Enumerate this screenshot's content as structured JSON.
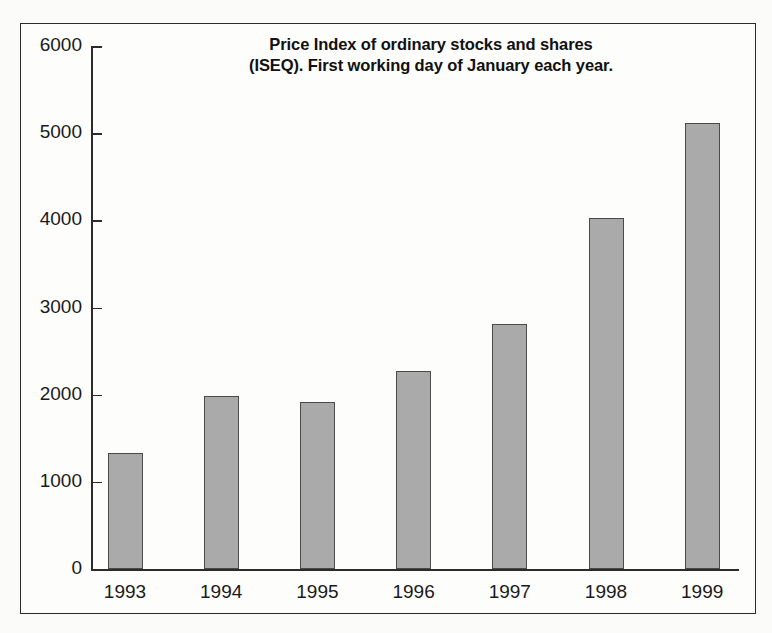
{
  "chart_data": {
    "type": "bar",
    "title": "Price Index of ordinary stocks and shares (ISEQ). First working day of January each year.",
    "title_lines": [
      "Price Index of ordinary stocks and shares",
      "(ISEQ). First working day of January each year."
    ],
    "categories": [
      "1993",
      "1994",
      "1995",
      "1996",
      "1997",
      "1998",
      "1999"
    ],
    "values": [
      1330,
      1985,
      1915,
      2270,
      2810,
      4030,
      5120
    ],
    "xlabel": "",
    "ylabel": "",
    "ylim": [
      0,
      6000
    ],
    "y_ticks": [
      "6000",
      "5000",
      "4000",
      "3000",
      "2000",
      "1000",
      "0"
    ],
    "y_tick_values": [
      6000,
      5000,
      4000,
      3000,
      2000,
      1000,
      0
    ],
    "y_tick_step": 1000,
    "grid": false,
    "legend": null,
    "legend_position": "none",
    "bar_color": "#aaaaaa",
    "bar_edge_color": "#4a4a4a",
    "axis_color": "#2b2b2b",
    "background_color": "#fdfdfc",
    "frame_color": "#2b2b2b",
    "text_color": "#1a1a1a"
  }
}
